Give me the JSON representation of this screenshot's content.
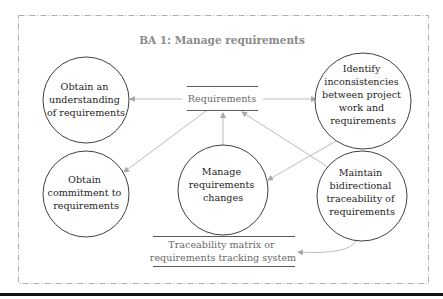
{
  "diagram": {
    "title": "BA 1: Manage requirements",
    "colors": {
      "border": "#9a9a9a",
      "circle_stroke": "#2a2a2a",
      "arrow": "#b4b4b4",
      "store_line": "#5a5a5a",
      "bottom_rule": "#111111"
    },
    "processes": [
      {
        "id": "understand",
        "lines": [
          "Obtain an",
          "understanding",
          "of requirements"
        ],
        "cx": 86,
        "cy": 100,
        "r": 43
      },
      {
        "id": "inconsistencies",
        "lines": [
          "Identify",
          "inconsistencies",
          "between project",
          "work and",
          "requirements"
        ],
        "cx": 363,
        "cy": 101,
        "r": 48
      },
      {
        "id": "commitment",
        "lines": [
          "Obtain",
          "commitment to",
          "requirements"
        ],
        "cx": 86,
        "cy": 194,
        "r": 43
      },
      {
        "id": "changes",
        "lines": [
          "Manage",
          "requirements",
          "changes"
        ],
        "cx": 223,
        "cy": 190,
        "r": 45
      },
      {
        "id": "traceability",
        "lines": [
          "Maintain",
          "bidirectional",
          "traceability of",
          "requirements"
        ],
        "cx": 362,
        "cy": 196,
        "r": 45
      }
    ],
    "data_stores": [
      {
        "id": "requirements-store",
        "lines": [
          "Requirements"
        ]
      },
      {
        "id": "tracking-store",
        "lines": [
          "Traceability matrix or",
          "requirements tracking system"
        ]
      }
    ],
    "flows": [
      {
        "from": "requirements-store",
        "to": "understand"
      },
      {
        "from": "requirements-store",
        "to": "inconsistencies"
      },
      {
        "from": "requirements-store",
        "to": "commitment"
      },
      {
        "from": "changes",
        "to": "requirements-store"
      },
      {
        "from": "traceability",
        "to": "requirements-store"
      },
      {
        "from": "inconsistencies",
        "to": "changes"
      },
      {
        "from": "requirements-store",
        "to": "traceability"
      },
      {
        "from": "traceability",
        "to": "tracking-store"
      }
    ]
  }
}
